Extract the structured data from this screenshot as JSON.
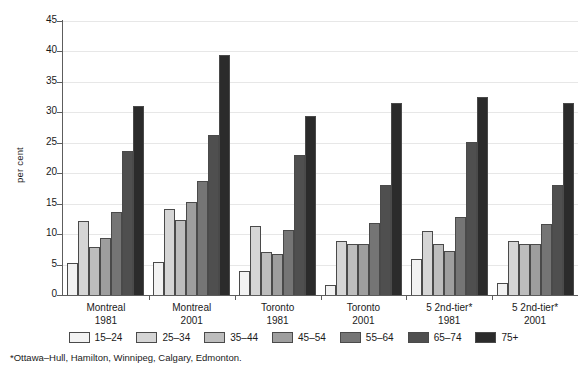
{
  "chart_data": {
    "type": "bar",
    "title": "",
    "xlabel": "",
    "ylabel": "per cent",
    "ylim": [
      0,
      45
    ],
    "yticks": [
      0,
      5,
      10,
      15,
      20,
      25,
      30,
      35,
      40,
      45
    ],
    "grid": true,
    "legend_position": "bottom",
    "categories": [
      {
        "name": "Montreal",
        "year": "1981"
      },
      {
        "name": "Montreal",
        "year": "2001"
      },
      {
        "name": "Toronto",
        "year": "1981"
      },
      {
        "name": "Toronto",
        "year": "2001"
      },
      {
        "name": "5 2nd-tier*",
        "year": "1981"
      },
      {
        "name": "5 2nd-tier*",
        "year": "2001"
      }
    ],
    "series": [
      {
        "name": "15–24",
        "color": "#f2f2f2",
        "values": [
          5.3,
          5.5,
          4.0,
          1.7,
          5.9,
          1.9
        ]
      },
      {
        "name": "25–34",
        "color": "#d5d5d5",
        "values": [
          12.1,
          14.2,
          11.3,
          8.8,
          10.5,
          8.8
        ]
      },
      {
        "name": "35–44",
        "color": "#bdbdbd",
        "values": [
          7.9,
          12.3,
          7.1,
          8.4,
          8.3,
          8.4
        ]
      },
      {
        "name": "45–54",
        "color": "#9e9e9e",
        "values": [
          9.3,
          15.2,
          6.7,
          8.4,
          7.2,
          8.4
        ]
      },
      {
        "name": "55–64",
        "color": "#757575",
        "values": [
          13.7,
          18.7,
          10.6,
          11.8,
          12.8,
          11.7
        ]
      },
      {
        "name": "65–74",
        "color": "#4f4f4f",
        "values": [
          23.6,
          26.2,
          23.0,
          18.0,
          25.1,
          18.0
        ]
      },
      {
        "name": "75+",
        "color": "#2b2b2b",
        "values": [
          31.0,
          39.4,
          29.4,
          31.5,
          32.6,
          31.5
        ]
      }
    ],
    "footnote": "*Ottawa–Hull, Hamilton, Winnipeg, Calgary, Edmonton."
  }
}
